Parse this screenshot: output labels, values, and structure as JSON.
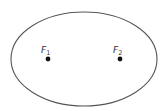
{
  "diagram": {
    "title": "",
    "shape": "ellipse",
    "foci": [
      {
        "label": "F",
        "subscript": "1"
      },
      {
        "label": "F",
        "subscript": "2"
      }
    ],
    "colors": {
      "outline": "#555555",
      "focus_point": "#111111",
      "label": "#333333",
      "background": "#ffffff"
    }
  }
}
